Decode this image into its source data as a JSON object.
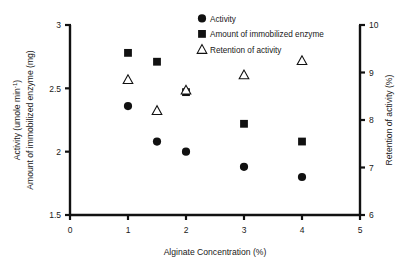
{
  "chart_data": {
    "type": "scatter",
    "title": "",
    "xlabel": "Alginate Concentration (%)",
    "ylabel_left_line1": "Activity (umole min",
    "ylabel_left_line1_sup": "-1",
    "ylabel_left_line1_end": ")",
    "ylabel_left_line2": "Amount of immobilized enzyme (mg)",
    "ylabel_right": "Retention of activity (%)",
    "xlim": [
      0,
      5
    ],
    "ylim_left": [
      1.5,
      3
    ],
    "ylim_right": [
      6,
      10
    ],
    "xticks": [
      "0",
      "1",
      "2",
      "3",
      "4",
      "5"
    ],
    "xtick_values": [
      0,
      1,
      2,
      3,
      4,
      5
    ],
    "yticks_left": [
      "1.5",
      "2",
      "2.5",
      "3"
    ],
    "ytick_left_values": [
      1.5,
      2,
      2.5,
      3
    ],
    "yticks_right": [
      "6",
      "7",
      "8",
      "9",
      "10"
    ],
    "ytick_right_values": [
      6,
      7,
      8,
      9,
      10
    ],
    "grid": false,
    "legend_position": "top-center",
    "series": [
      {
        "name": "Activity",
        "marker": "filled-circle",
        "axis": "left",
        "color": "#111111",
        "x": [
          1,
          1.5,
          2,
          3,
          4
        ],
        "values": [
          2.36,
          2.08,
          2.0,
          1.88,
          1.8
        ]
      },
      {
        "name": "Amount of immobilized enzyme",
        "marker": "filled-square",
        "axis": "left",
        "color": "#111111",
        "x": [
          1,
          1.5,
          2,
          3,
          4
        ],
        "values": [
          2.78,
          2.71,
          2.47,
          2.22,
          2.08
        ]
      },
      {
        "name": "Retention of activity",
        "marker": "open-triangle",
        "axis": "right",
        "color": "#111111",
        "x": [
          1,
          1.5,
          2,
          3,
          4
        ],
        "values": [
          8.85,
          8.2,
          8.63,
          8.95,
          9.25
        ]
      }
    ]
  }
}
